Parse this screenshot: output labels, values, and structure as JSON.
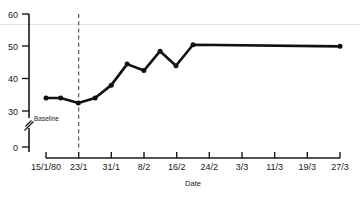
{
  "chart_data": {
    "type": "line",
    "title": "",
    "xlabel": "Date",
    "ylabel": "",
    "x": [
      "15/1/80",
      "23/1",
      "31/1",
      "8/2",
      "16/2",
      "24/2",
      "3/3",
      "11/3",
      "19/3",
      "27/3"
    ],
    "xtick_labels": [
      "15/1/80",
      "23/1",
      "31/1",
      "8/2",
      "16/2",
      "24/2",
      "3/3",
      "11/3",
      "19/3",
      "27/3"
    ],
    "ytick_labels": [
      "0",
      "30",
      "40",
      "50",
      "60"
    ],
    "ytick_values": [
      0,
      30,
      40,
      50,
      60
    ],
    "ylim": [
      30,
      60
    ],
    "y_axis_break": true,
    "y_axis_break_between": [
      0,
      30
    ],
    "grid": false,
    "legend": "none",
    "series": [
      {
        "name": "measurement",
        "marker": "filled-circle",
        "color": "#111111",
        "points": [
          {
            "x": "15/1/80",
            "x_frac": 0.0,
            "y": 34.0
          },
          {
            "x": "19/1",
            "x_frac": 0.05,
            "y": 34.0
          },
          {
            "x": "23/1",
            "x_frac": 0.11,
            "y": 32.5
          },
          {
            "x": "27/1",
            "x_frac": 0.167,
            "y": 34.0
          },
          {
            "x": "31/1",
            "x_frac": 0.222,
            "y": 38.0
          },
          {
            "x": "4/2",
            "x_frac": 0.276,
            "y": 44.5
          },
          {
            "x": "8/2",
            "x_frac": 0.333,
            "y": 42.5
          },
          {
            "x": "12/2",
            "x_frac": 0.388,
            "y": 48.5
          },
          {
            "x": "16/2",
            "x_frac": 0.442,
            "y": 44.0
          },
          {
            "x": "20/2",
            "x_frac": 0.5,
            "y": 50.5
          },
          {
            "x": "27/3",
            "x_frac": 1.0,
            "y": 50.0
          }
        ]
      }
    ],
    "annotations": [
      {
        "name": "baseline-label",
        "text": "Baseline",
        "x_frac": 0.0,
        "y": 31.0
      },
      {
        "name": "intervention-line",
        "style": "dashed-vertical",
        "at_x": "23/1",
        "x_frac": 0.11
      }
    ]
  }
}
